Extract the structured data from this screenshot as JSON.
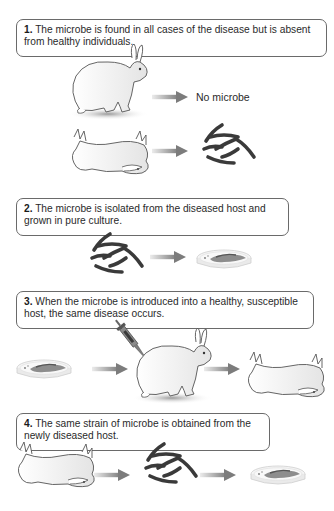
{
  "steps": [
    {
      "number": "1.",
      "text": " The microbe is found in all cases of the disease but is absent from healthy individuals.",
      "annotations": {
        "healthy_result": "No microbe"
      },
      "illustrations": [
        "healthy-rabbit",
        "arrow",
        "no-microbe-label",
        "dead-rabbit",
        "arrow",
        "microbes"
      ]
    },
    {
      "number": "2.",
      "text": " The microbe is isolated from the diseased host and grown in pure culture.",
      "illustrations": [
        "microbes",
        "arrow",
        "petri-dish"
      ]
    },
    {
      "number": "3.",
      "text": " When the microbe is introduced into a healthy, susceptible host, the same disease occurs.",
      "illustrations": [
        "petri-dish",
        "arrow",
        "syringe",
        "healthy-rabbit",
        "arrow",
        "dead-rabbit"
      ]
    },
    {
      "number": "4.",
      "text": " The same strain of microbe is obtained from the newly diseased host.",
      "illustrations": [
        "dead-rabbit",
        "arrow",
        "microbes",
        "arrow",
        "petri-dish"
      ]
    }
  ],
  "colors": {
    "box_border": "#6a6a6a",
    "arrow": "#8a8a8a",
    "microbe": "#3a3a3a",
    "rabbit_outline": "#555555",
    "shadow": "#bdbdbd"
  }
}
